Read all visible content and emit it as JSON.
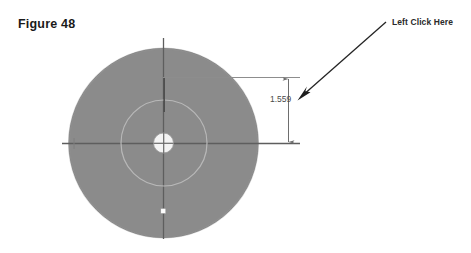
{
  "figure": {
    "caption": "Figure 48"
  },
  "callout": {
    "label": "Left Click Here",
    "arrow_icon": "arrow-down-left-icon"
  },
  "drawing": {
    "part_name": "circular-disc-part",
    "dimension": {
      "value": "1.559",
      "icon": "vertical-dimension-arrows-icon"
    },
    "features": {
      "outer_disc": "outer-disc-face",
      "inner_circle": "inner-circle-edge",
      "center_bore": "center-bore-hole",
      "horizontal_centerline": "horizontal-centerline",
      "vertical_centerline": "vertical-centerline",
      "sketch_point": "sketch-point-marker"
    }
  },
  "colors": {
    "background": "#ffffff",
    "disc_fill": "#8b8b8b",
    "disc_edge": "#7d7d7d",
    "centerline": "#5e5e5e",
    "dimension_line": "#6e6e6e",
    "inner_circle": "#b3b3b3",
    "bore_fill": "#f2f2f2",
    "callout_arrow": "#222222",
    "text": "#1a1a1a"
  }
}
